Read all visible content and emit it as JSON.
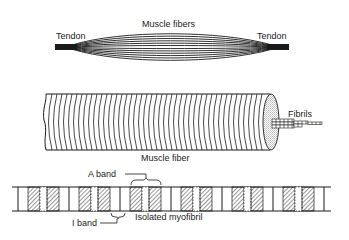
{
  "diagram": {
    "colors": {
      "ink": "#1a1a1a",
      "background": "#ffffff",
      "stipple": "#9a9a9a"
    },
    "panels": [
      {
        "id": "muscle",
        "labels": {
          "muscle_fibers": "Muscle fibers",
          "tendon_left": "Tendon",
          "tendon_right": "Tendon"
        }
      },
      {
        "id": "fiber",
        "labels": {
          "muscle_fiber": "Muscle fiber",
          "fibrils": "Fibrils"
        }
      },
      {
        "id": "myofibril",
        "labels": {
          "a_band": "A band",
          "i_band": "I band",
          "isolated_myofibril": "Isolated myofibril"
        },
        "sarcomere_count": 6
      }
    ]
  }
}
